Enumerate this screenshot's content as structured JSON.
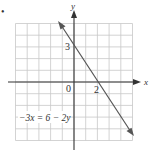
{
  "chart_data": {
    "type": "line",
    "title": "",
    "xlabel": "x",
    "ylabel": "y",
    "xlim": [
      -5,
      5
    ],
    "ylim": [
      -5,
      5
    ],
    "grid": true,
    "tick_labels": {
      "origin": "0",
      "x_intercept": "2",
      "y_intercept": "3"
    },
    "series": [
      {
        "name": "-3x = 6 - 2y",
        "equation": "-3x = 6 - 2y",
        "slope": -1.5,
        "intercept": 3,
        "points": [
          [
            -1.2,
            4.8
          ],
          [
            0,
            3
          ],
          [
            2,
            0
          ],
          [
            5,
            -4.5
          ]
        ],
        "arrows": "both"
      }
    ],
    "annotations": [
      {
        "text": "-3x = 6 - 2y",
        "x": -4.8,
        "y": -2.3
      }
    ]
  },
  "labels": {
    "bullet": "•",
    "x_axis": "x",
    "y_axis": "y",
    "origin": "0",
    "x_intercept": "2",
    "y_intercept": "3",
    "equation": "−3x = 6 − 2y"
  },
  "colors": {
    "grid": "#c8c8c8",
    "axis": "#333333",
    "line": "#555555",
    "text": "#333333"
  }
}
